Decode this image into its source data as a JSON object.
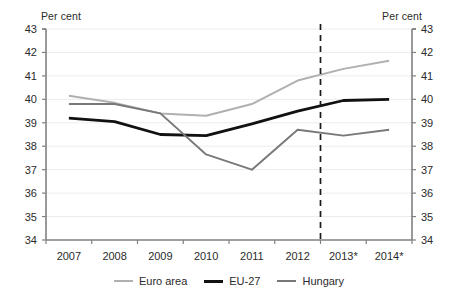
{
  "chart_data": {
    "type": "line",
    "title": "",
    "subtitle": "",
    "xlabel": "",
    "ylabel": "Per cent",
    "ylabel_right": "Per cent",
    "categories": [
      "2007",
      "2008",
      "2009",
      "2010",
      "2011",
      "2012",
      "2013*",
      "2014*"
    ],
    "ylim": [
      34,
      43
    ],
    "ytick_labels": [
      "43",
      "42",
      "41",
      "40",
      "39",
      "38",
      "37",
      "36",
      "35",
      "34"
    ],
    "ytick_values": [
      43,
      42,
      41,
      40,
      39,
      38,
      37,
      36,
      35,
      34
    ],
    "grid": true,
    "legend_position": "bottom-center",
    "series": [
      {
        "name": "Euro area",
        "color": "#b0b0b0",
        "width": 2.0,
        "values": [
          40.15,
          39.85,
          39.4,
          39.3,
          39.8,
          40.8,
          41.3,
          41.65
        ]
      },
      {
        "name": "EU-27",
        "color": "#111111",
        "width": 2.8,
        "values": [
          39.2,
          39.05,
          38.5,
          38.45,
          38.95,
          39.5,
          39.95,
          40.0
        ]
      },
      {
        "name": "Hungary",
        "color": "#787878",
        "width": 1.9,
        "values": [
          39.8,
          39.8,
          39.4,
          37.65,
          37.0,
          38.7,
          38.45,
          38.7
        ]
      }
    ],
    "annotations": [
      {
        "type": "vertical-dashed-line",
        "name": "forecast-divider",
        "between": [
          "2012",
          "2013*"
        ],
        "x_value": 5.5,
        "color": "#1a1a1a"
      }
    ]
  },
  "legend": {
    "items": [
      {
        "label": "Euro area",
        "color": "#b0b0b0",
        "width": 2.0
      },
      {
        "label": "EU-27",
        "color": "#111111",
        "width": 3.0
      },
      {
        "label": "Hungary",
        "color": "#787878",
        "width": 2.0
      }
    ]
  }
}
